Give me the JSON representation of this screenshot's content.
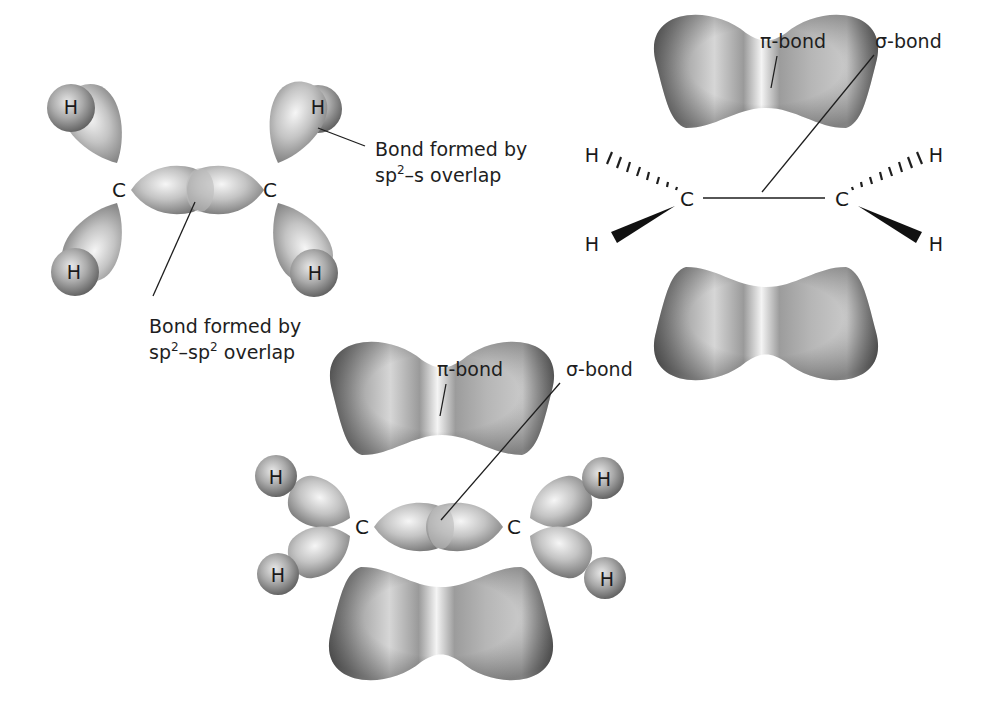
{
  "panels": {
    "sp2_framework": {
      "atoms": {
        "carbon": "C",
        "hydrogen": "H"
      },
      "callouts": {
        "sp2_s": {
          "line1": "Bond formed by",
          "prefix": "sp",
          "sup": "2",
          "suffix": "–s overlap"
        },
        "sp2_sp2": {
          "line1": "Bond formed by",
          "prefix": "sp",
          "sup": "2",
          "mid": "–sp",
          "sup2": "2",
          "suffix": " overlap"
        }
      }
    },
    "pi_sigma_wedge": {
      "atoms": {
        "carbon": "C",
        "hydrogen": "H"
      },
      "labels": {
        "pi": "π-bond",
        "sigma": "σ-bond"
      }
    },
    "combined": {
      "atoms": {
        "carbon": "C",
        "hydrogen": "H"
      },
      "labels": {
        "pi": "π-bond",
        "sigma": "σ-bond"
      }
    }
  },
  "colors": {
    "lobe_light": "#f2f2f2",
    "lobe_mid": "#b8b8b8",
    "lobe_dark": "#6e6e6e",
    "ink": "#1e1e1e"
  }
}
